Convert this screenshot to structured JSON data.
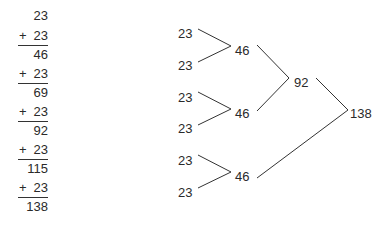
{
  "column_addition": {
    "start": "23",
    "steps": [
      {
        "operator": "+",
        "addend": "23",
        "sum": "46"
      },
      {
        "operator": "+",
        "addend": "23",
        "sum": "69"
      },
      {
        "operator": "+",
        "addend": "23",
        "sum": "92"
      },
      {
        "operator": "+",
        "addend": "23",
        "sum": "115"
      },
      {
        "operator": "+",
        "addend": "23",
        "sum": "138"
      }
    ]
  },
  "tree": {
    "leaves": [
      "23",
      "23",
      "23",
      "23",
      "23",
      "23"
    ],
    "level1": [
      "46",
      "46",
      "46"
    ],
    "level2": [
      "92"
    ],
    "root": "138"
  }
}
